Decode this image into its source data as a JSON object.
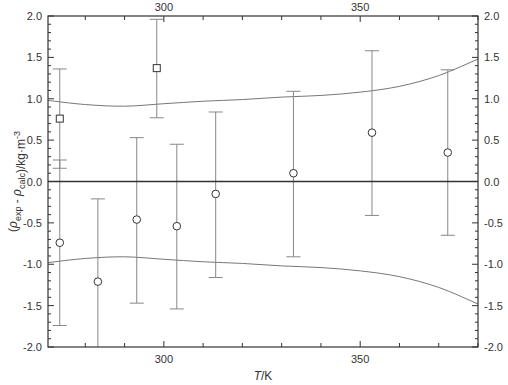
{
  "chart_data": {
    "type": "scatter",
    "title": "",
    "xlabel": "T/K",
    "xlabel_italic_part": "T",
    "xlabel_unit": "/K",
    "ylabel": "(ρexp - ρcalc)/kg·m-3",
    "xlim": [
      270.5,
      380
    ],
    "ylim": [
      -2.0,
      2.0
    ],
    "x_ticks_major": [
      300,
      350
    ],
    "x_tick_labels": [
      "300",
      "350"
    ],
    "x_ticks_minor_step": 10,
    "y_ticks": [
      -2.0,
      -1.5,
      -1.0,
      -0.5,
      0.0,
      0.5,
      1.0,
      1.5,
      2.0
    ],
    "y_tick_labels": [
      "-2.0",
      "-1.5",
      "-1.0",
      "-0.5",
      "0.0",
      "0.5",
      "1.0",
      "1.5",
      "2.0"
    ],
    "y_ticks_minor_step": 0.1,
    "grid": false,
    "mirror_axes": true,
    "zero_line": true,
    "series": [
      {
        "name": "squares",
        "marker": "square",
        "points": [
          {
            "x": 273.5,
            "y": 0.76,
            "err_low": 0.16,
            "err_high": 1.36
          },
          {
            "x": 298.2,
            "y": 1.37,
            "err_low": 0.77,
            "err_high": 1.96
          }
        ]
      },
      {
        "name": "circles",
        "marker": "circle",
        "points": [
          {
            "x": 273.5,
            "y": -0.74,
            "err_low": -1.74,
            "err_high": 0.26
          },
          {
            "x": 283.2,
            "y": -1.21,
            "err_low": -2.21,
            "err_high": -0.21
          },
          {
            "x": 293.1,
            "y": -0.46,
            "err_low": -1.47,
            "err_high": 0.53
          },
          {
            "x": 303.3,
            "y": -0.54,
            "err_low": -1.54,
            "err_high": 0.45
          },
          {
            "x": 313.2,
            "y": -0.15,
            "err_low": -1.16,
            "err_high": 0.84
          },
          {
            "x": 333.0,
            "y": 0.1,
            "err_low": -0.91,
            "err_high": 1.09
          },
          {
            "x": 353.0,
            "y": 0.59,
            "err_low": -0.41,
            "err_high": 1.58
          },
          {
            "x": 372.3,
            "y": 0.35,
            "err_low": -0.65,
            "err_high": 1.35
          }
        ]
      },
      {
        "name": "upper-uncertainty-band",
        "type": "line",
        "x": [
          270.5,
          280,
          290,
          300,
          310,
          320,
          330,
          340,
          350,
          360,
          370,
          380
        ],
        "y": [
          0.98,
          0.93,
          0.91,
          0.94,
          0.97,
          0.99,
          1.02,
          1.04,
          1.08,
          1.15,
          1.28,
          1.48
        ]
      },
      {
        "name": "lower-uncertainty-band",
        "type": "line",
        "x": [
          270.5,
          280,
          290,
          300,
          310,
          320,
          330,
          340,
          350,
          360,
          370,
          380
        ],
        "y": [
          -0.98,
          -0.93,
          -0.91,
          -0.94,
          -0.97,
          -0.99,
          -1.02,
          -1.04,
          -1.08,
          -1.15,
          -1.28,
          -1.48
        ]
      }
    ]
  },
  "colors": {
    "axis": "#333333",
    "curve": "#777777",
    "errorbar": "#888888",
    "marker_stroke": "#333333",
    "marker_fill": "#ffffff"
  }
}
